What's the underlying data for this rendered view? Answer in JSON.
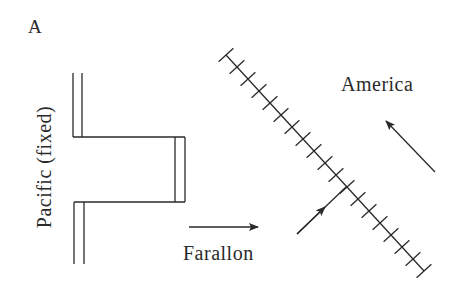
{
  "figure": {
    "panel_label": "A",
    "plates": {
      "pacific": "Pacific (fixed)",
      "farallon": "Farallon",
      "america": "America"
    },
    "colors": {
      "line": "#2a2a2a",
      "background": "#ffffff"
    },
    "elements": {
      "spreading_ridge": "stepped double-line ridge with transform fault (left)",
      "subduction_zone": "diagonal line with cross ticks (trench)",
      "arrows": [
        "farallon-motion-arrow-east",
        "farallon-motion-arrow-northeast",
        "america-motion-arrow-northwest"
      ]
    }
  }
}
